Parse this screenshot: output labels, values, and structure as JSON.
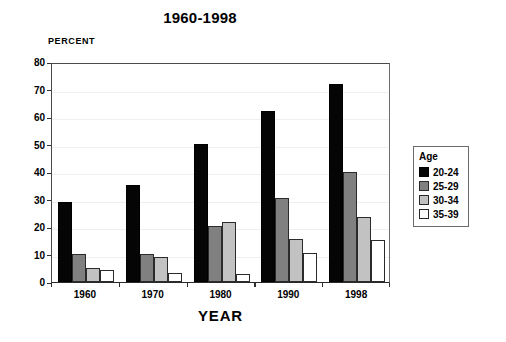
{
  "chart_data": {
    "type": "bar",
    "title": "1960-1998",
    "xlabel": "YEAR",
    "ylabel": "PERCENT",
    "categories": [
      "1960",
      "1970",
      "1980",
      "1990",
      "1998"
    ],
    "ylim": [
      0,
      80
    ],
    "yticks": [
      0,
      10,
      20,
      30,
      40,
      50,
      60,
      70,
      80
    ],
    "grid": true,
    "legend_title": "Age",
    "legend_position": "right",
    "series": [
      {
        "name": "20-24",
        "color": "#050505",
        "values": [
          29.0,
          35.2,
          50.2,
          62.3,
          72.0
        ]
      },
      {
        "name": "25-29",
        "color": "#808080",
        "values": [
          10.3,
          10.3,
          20.5,
          30.7,
          40.0
        ]
      },
      {
        "name": "30-34",
        "color": "#c2c2c2",
        "values": [
          5.2,
          9.2,
          22.0,
          15.7,
          23.5
        ]
      },
      {
        "name": "35-39",
        "color": "#ffffff",
        "values": [
          4.2,
          3.3,
          3.0,
          10.6,
          15.4
        ]
      }
    ]
  }
}
